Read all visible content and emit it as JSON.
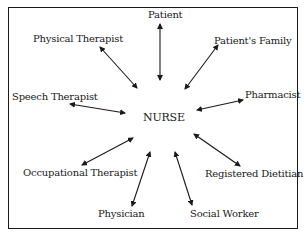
{
  "diagram": {
    "center": "NURSE",
    "nodes": [
      {
        "id": "patient",
        "label": "Patient"
      },
      {
        "id": "patients-family",
        "label": "Patient's Family"
      },
      {
        "id": "pharmacist",
        "label": "Pharmacist"
      },
      {
        "id": "registered-dietitian",
        "label": "Registered Dietitian"
      },
      {
        "id": "social-worker",
        "label": "Social Worker"
      },
      {
        "id": "physician",
        "label": "Physician"
      },
      {
        "id": "occupational-therapist",
        "label": "Occupational Therapist"
      },
      {
        "id": "speech-therapist",
        "label": "Speech Therapist"
      },
      {
        "id": "physical-therapist",
        "label": "Physical Therapist"
      }
    ],
    "edge_style": "bidirectional-arrow",
    "colors": {
      "line": "#1a1a1a",
      "background": "#ffffff"
    }
  }
}
